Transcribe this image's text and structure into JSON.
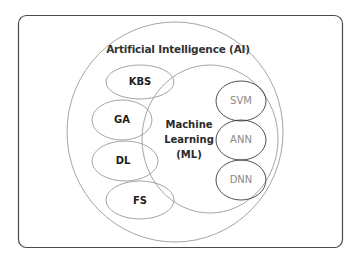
{
  "diagram": {
    "type": "nested-venn",
    "frame": {
      "stroke": "#4a4a4a"
    },
    "ai": {
      "label": "Artificial Intelligence (AI)",
      "stroke": "#9a9a9a"
    },
    "ml": {
      "label_lines": [
        "Machine",
        "Learning",
        "(ML)"
      ],
      "stroke": "#9a9a9a"
    },
    "ai_subfields": [
      {
        "label": "KBS"
      },
      {
        "label": "GA"
      },
      {
        "label": "DL"
      },
      {
        "label": "FS"
      }
    ],
    "ml_subfields": [
      {
        "label": "SVM"
      },
      {
        "label": "ANN"
      },
      {
        "label": "DNN"
      }
    ],
    "colors": {
      "light_stroke": "#9a9a9a",
      "dark_stroke": "#3c3c3c",
      "ml_item_text": "#8a8a8a"
    }
  }
}
